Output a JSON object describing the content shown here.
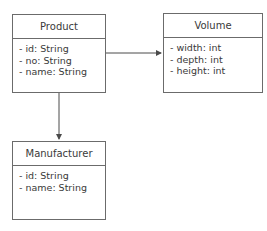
{
  "diagram": {
    "type": "uml-class-diagram",
    "classes": [
      {
        "id": "product",
        "name": "Product",
        "attributes": [
          "- id: String",
          "- no: String",
          "- name: String"
        ]
      },
      {
        "id": "volume",
        "name": "Volume",
        "attributes": [
          "- width: int",
          "- depth: int",
          "- height: int"
        ]
      },
      {
        "id": "manufacturer",
        "name": "Manufacturer",
        "attributes": [
          "- id: String",
          "- name: String"
        ]
      }
    ],
    "associations": [
      {
        "from": "Product",
        "to": "Volume",
        "arrow": "directed"
      },
      {
        "from": "Product",
        "to": "Manufacturer",
        "arrow": "directed"
      }
    ],
    "colors": {
      "line": "#4a4a4a",
      "border": "#6b6b6b",
      "text": "#3a3a3a",
      "background": "#ffffff"
    }
  }
}
